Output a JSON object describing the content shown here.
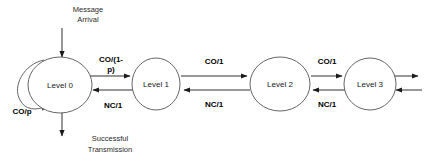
{
  "diagram": {
    "type": "state-transition-diagram",
    "stroke_color": "#1a1a1a",
    "node_stroke_color": "#555555",
    "background_color": "#ffffff",
    "states": [
      {
        "id": "level0",
        "label": "Level  0",
        "cx": 60,
        "cy": 85,
        "rx": 32,
        "ry": 28
      },
      {
        "id": "level1",
        "label": "Level 1",
        "cx": 156,
        "cy": 84,
        "rx": 24,
        "ry": 26
      },
      {
        "id": "level2",
        "label": "Level 2",
        "cx": 280,
        "cy": 84,
        "rx": 30,
        "ry": 27
      },
      {
        "id": "level3",
        "label": "Level 3",
        "cx": 370,
        "cy": 84,
        "rx": 26,
        "ry": 26
      }
    ],
    "transitions": [
      {
        "id": "l0-to-l1",
        "label": "CO/(1-",
        "label_line2": "p)",
        "from": "level0",
        "to": "level1",
        "direction": "right"
      },
      {
        "id": "l1-to-l0",
        "label": "NC/1",
        "from": "level1",
        "to": "level0",
        "direction": "left"
      },
      {
        "id": "l1-to-l2",
        "label": "CO/1",
        "from": "level1",
        "to": "level2",
        "direction": "right"
      },
      {
        "id": "l2-to-l1",
        "label": "NC/1",
        "from": "level2",
        "to": "level1",
        "direction": "left"
      },
      {
        "id": "l2-to-l3",
        "label": "CO/1",
        "from": "level2",
        "to": "level3",
        "direction": "right"
      },
      {
        "id": "l3-to-l2",
        "label": "NC/1",
        "from": "level3",
        "to": "level2",
        "direction": "left"
      },
      {
        "id": "l0-self-loop",
        "label": "CO/p",
        "from": "level0",
        "to": "level0",
        "direction": "loop"
      },
      {
        "id": "l3-out",
        "label": "",
        "from": "level3",
        "to": "continues",
        "direction": "right"
      },
      {
        "id": "l3-in",
        "label": "",
        "from": "continues",
        "to": "level3",
        "direction": "left"
      }
    ],
    "annotations": [
      {
        "id": "message-arrival",
        "line1": "Message",
        "line2": "Arrival",
        "x": 88,
        "y": 12
      },
      {
        "id": "successful-transmission",
        "line1": "Successful",
        "line2": "Transmission",
        "x": 110,
        "y": 141
      }
    ]
  }
}
